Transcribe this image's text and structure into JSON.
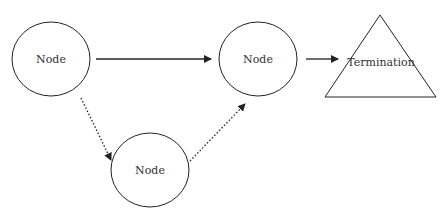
{
  "diagram": {
    "colors": {
      "stroke": "#222222",
      "text": "#333333",
      "background": "#ffffff"
    },
    "nodes": [
      {
        "id": "node-1",
        "shape": "ellipse",
        "label": "Node",
        "cx": 51,
        "cy": 59,
        "rx": 39,
        "ry": 37
      },
      {
        "id": "node-2",
        "shape": "ellipse",
        "label": "Node",
        "cx": 258,
        "cy": 59,
        "rx": 39,
        "ry": 37
      },
      {
        "id": "node-3",
        "shape": "ellipse",
        "label": "Node",
        "cx": 150,
        "cy": 170,
        "rx": 39,
        "ry": 37
      },
      {
        "id": "termination",
        "shape": "triangle",
        "label": "Termination",
        "points": [
          [
            380,
            15
          ],
          [
            436,
            97
          ],
          [
            325,
            97
          ]
        ]
      }
    ],
    "edges": [
      {
        "from": "node-1",
        "to": "node-2",
        "style": "solid"
      },
      {
        "from": "node-2",
        "to": "termination",
        "style": "solid"
      },
      {
        "from": "node-1",
        "to": "node-3",
        "style": "dotted"
      },
      {
        "from": "node-3",
        "to": "node-2",
        "style": "dotted"
      }
    ]
  }
}
